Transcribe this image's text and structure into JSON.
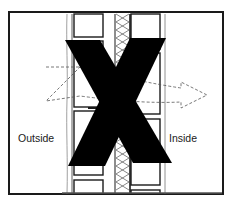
{
  "diagram": {
    "labels": {
      "outside": "Outside",
      "inside": "Inside"
    },
    "elements": [
      "frame-border",
      "outer-wall-line",
      "masonry-block-column-outside",
      "insulation-batt",
      "masonry-block-column-inside",
      "interior-wall-line",
      "dashed-airflow-arrow",
      "x-mark"
    ],
    "colors": {
      "line": "#1a1a1a",
      "x_mark": "#000000",
      "dashed": "#555555",
      "background": "#ffffff"
    }
  }
}
